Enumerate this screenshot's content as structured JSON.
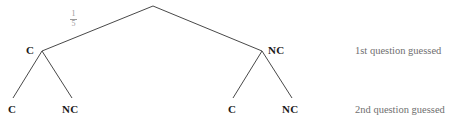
{
  "diagram": {
    "type": "probability-tree",
    "background_color": "#ffffff",
    "line_color": "#333333",
    "node_text_color": "#1a1a1a",
    "caption_text_color": "#6f6f6f",
    "fraction_text_color": "#9a9a9a",
    "root": {
      "label": "",
      "x": 153,
      "y": 6
    },
    "branch_labels": [
      {
        "name": "root-to-left-branch-probability",
        "numerator": "1",
        "denominator": "5",
        "x": 72,
        "y": 11
      }
    ],
    "level1": {
      "caption": "1st question guessed",
      "caption_x": 355,
      "caption_y": 46,
      "nodes": [
        {
          "label": "C",
          "x": 26,
          "y": 45,
          "vertex_x": 42,
          "vertex_y": 51
        },
        {
          "label": "NC",
          "x": 268,
          "y": 45,
          "vertex_x": 262,
          "vertex_y": 51
        }
      ]
    },
    "level2": {
      "caption": "2nd question guessed",
      "caption_x": 355,
      "caption_y": 105,
      "nodes": [
        {
          "label": "C",
          "x": 8,
          "y": 104,
          "vertex_x": 13,
          "vertex_y": 98
        },
        {
          "label": "NC",
          "x": 62,
          "y": 104,
          "vertex_x": 72,
          "vertex_y": 98
        },
        {
          "label": "C",
          "x": 228,
          "y": 104,
          "vertex_x": 233,
          "vertex_y": 98
        },
        {
          "label": "NC",
          "x": 282,
          "y": 104,
          "vertex_x": 292,
          "vertex_y": 98
        }
      ]
    },
    "edges": [
      {
        "name": "edge-root-to-c",
        "x1": 153,
        "y1": 6,
        "x2": 42,
        "y2": 51
      },
      {
        "name": "edge-root-to-nc",
        "x1": 153,
        "y1": 6,
        "x2": 262,
        "y2": 51
      },
      {
        "name": "edge-c-to-c",
        "x1": 42,
        "y1": 51,
        "x2": 13,
        "y2": 98
      },
      {
        "name": "edge-c-to-nc",
        "x1": 42,
        "y1": 51,
        "x2": 72,
        "y2": 98
      },
      {
        "name": "edge-nc-to-c",
        "x1": 262,
        "y1": 51,
        "x2": 233,
        "y2": 98
      },
      {
        "name": "edge-nc-to-nc",
        "x1": 262,
        "y1": 51,
        "x2": 292,
        "y2": 98
      }
    ]
  }
}
